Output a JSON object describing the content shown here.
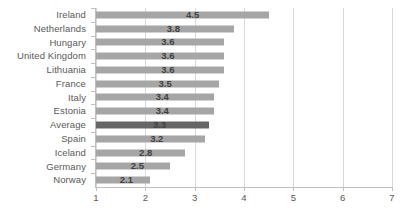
{
  "chart_data": {
    "type": "bar",
    "orientation": "horizontal",
    "title": "",
    "subtitle": "",
    "xlabel": "",
    "ylabel": "",
    "xlim": [
      1,
      7
    ],
    "xticks": [
      1,
      2,
      3,
      4,
      5,
      6,
      7
    ],
    "xtick_labels": [
      "1",
      "2",
      "3",
      "4",
      "5",
      "6",
      "7"
    ],
    "grid": "vertical",
    "legend": "none",
    "bar_baseline": 1,
    "categories": [
      "Ireland",
      "Netherlands",
      "Hungary",
      "United Kingdom",
      "Lithuania",
      "France",
      "Italy",
      "Estonia",
      "Average",
      "Spain",
      "Iceland",
      "Germany",
      "Norway"
    ],
    "values": [
      4.5,
      3.8,
      3.6,
      3.6,
      3.6,
      3.5,
      3.4,
      3.4,
      3.3,
      3.2,
      2.8,
      2.5,
      2.1
    ],
    "data_labels": [
      "4.5",
      "3.8",
      "3.6",
      "3.6",
      "3.6",
      "3.5",
      "3.4",
      "3.4",
      "3.3",
      "3.2",
      "2.8",
      "2.5",
      "2.1"
    ],
    "highlight_category": "Average",
    "colors": {
      "bar": "#a6a6a6",
      "bar_highlight": "#666666",
      "gridline": "#d9d9d9",
      "axis": "#bfbfbf",
      "label_text": "#595959",
      "value_text": "#404040",
      "background": "#ffffff"
    }
  }
}
